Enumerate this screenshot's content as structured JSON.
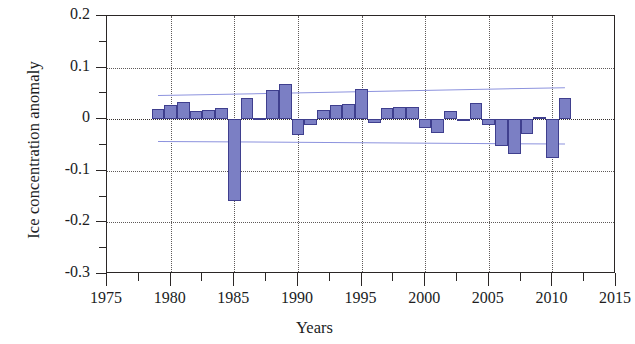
{
  "figure": {
    "background": "#ffffff",
    "bar_fill": "#7b7fc4",
    "bar_stroke": "#3f3f8e",
    "trend_color": "#8d93de",
    "axis_color": "#2b2726"
  },
  "axes": {
    "y_title": "Ice concentration anomaly",
    "x_title": "Years",
    "y_ticks": [
      "0.2",
      "0.1",
      "0",
      "-0.1",
      "-0.2",
      "-0.3"
    ],
    "y_tick_values": [
      0.2,
      0.1,
      0,
      -0.1,
      -0.2,
      -0.3
    ],
    "y_minor_values": [
      0.15,
      0.05,
      -0.05,
      -0.15,
      -0.25
    ],
    "x_ticks": [
      "1975",
      "1980",
      "1985",
      "1990",
      "1995",
      "2000",
      "2005",
      "2010",
      "2015"
    ],
    "x_tick_values": [
      1975,
      1980,
      1985,
      1990,
      1995,
      2000,
      2005,
      2010,
      2015
    ],
    "x_minor_values": [
      1977.5,
      1982.5,
      1987.5,
      1992.5,
      1997.5,
      2002.5,
      2007.5,
      2012.5
    ]
  },
  "chart_data": {
    "type": "bar",
    "title": "",
    "xlabel": "Years",
    "ylabel": "Ice concentration anomaly",
    "xlim": [
      1975,
      2015
    ],
    "ylim": [
      -0.3,
      0.2
    ],
    "grid": true,
    "legend": "none",
    "categories": [
      1979,
      1980,
      1981,
      1982,
      1983,
      1984,
      1985,
      1986,
      1987,
      1988,
      1989,
      1990,
      1991,
      1992,
      1993,
      1994,
      1995,
      1996,
      1997,
      1998,
      1999,
      2000,
      2001,
      2002,
      2003,
      2004,
      2005,
      2006,
      2007,
      2008,
      2009,
      2010,
      2011
    ],
    "values": [
      0.019,
      0.027,
      0.034,
      0.015,
      0.017,
      0.021,
      -0.158,
      0.041,
      0.003,
      0.056,
      0.068,
      -0.031,
      -0.012,
      0.018,
      0.028,
      0.029,
      0.059,
      -0.008,
      0.021,
      0.023,
      0.023,
      -0.018,
      -0.026,
      0.015,
      -0.003,
      0.032,
      -0.011,
      -0.051,
      -0.068,
      -0.028,
      0.004,
      -0.076,
      0.042
    ],
    "series": [
      {
        "name": "Ice concentration anomaly",
        "values": [
          0.019,
          0.027,
          0.034,
          0.015,
          0.017,
          0.021,
          -0.158,
          0.041,
          0.003,
          0.056,
          0.068,
          -0.031,
          -0.012,
          0.018,
          0.028,
          0.029,
          0.059,
          -0.008,
          0.021,
          0.023,
          0.023,
          -0.018,
          -0.026,
          0.015,
          -0.003,
          0.032,
          -0.011,
          -0.051,
          -0.068,
          -0.028,
          0.004,
          -0.076,
          0.042
        ]
      }
    ],
    "trend_lines": [
      {
        "name": "upper-envelope",
        "x": [
          1979,
          2011
        ],
        "y": [
          0.047,
          0.062
        ]
      },
      {
        "name": "lower-envelope",
        "x": [
          1979,
          2011
        ],
        "y": [
          -0.042,
          -0.047
        ]
      }
    ]
  }
}
